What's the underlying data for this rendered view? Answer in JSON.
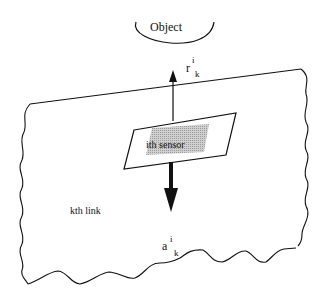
{
  "diagram": {
    "type": "sensor-on-link schematic",
    "object_label": "Object",
    "sensor_label": "ith sensor",
    "link_label": "kth link",
    "r_vector": {
      "base": "r",
      "superscript": "i",
      "subscript": "k"
    },
    "a_vector": {
      "base": "a",
      "superscript": "i",
      "subscript": "k"
    },
    "colors": {
      "line": "#111111",
      "sensor_shading": "#bdbdbd",
      "background": "#ffffff"
    }
  }
}
